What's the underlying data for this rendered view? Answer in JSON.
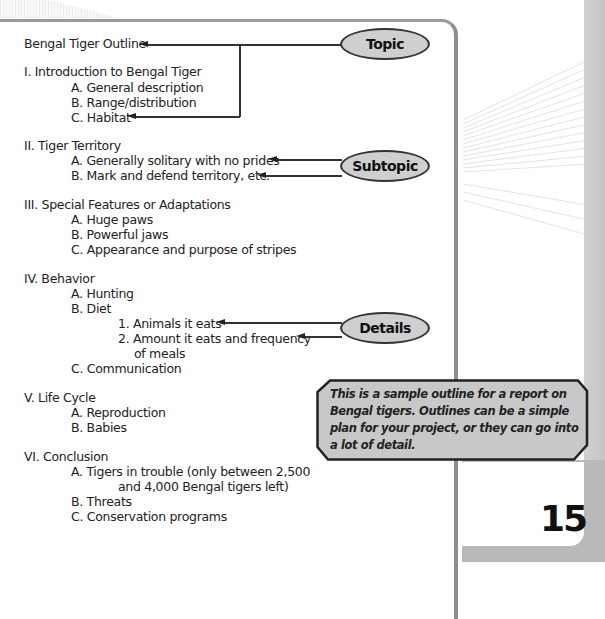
{
  "outline": {
    "title": "Bengal Tiger Outline",
    "sections": [
      {
        "heading": "I. Introduction to Bengal Tiger",
        "items": [
          "A.  General description",
          "B.  Range/distribution",
          "C.  Habitat"
        ]
      },
      {
        "heading": "II. Tiger Territory",
        "items": [
          "A.  Generally solitary with no prides",
          "B.  Mark and defend territory, etc."
        ]
      },
      {
        "heading": "III. Special Features or Adaptations",
        "items": [
          "A.  Huge paws",
          "B.  Powerful jaws",
          "C.  Appearance and purpose of stripes"
        ]
      },
      {
        "heading": "IV. Behavior",
        "items": [
          "A.  Hunting",
          "B.  Diet",
          "1.  Animals it eats",
          "2.  Amount it eats and frequency",
          "of meals",
          "C.  Communication"
        ]
      },
      {
        "heading": "V. Life Cycle",
        "items": [
          "A.  Reproduction",
          "B.  Babies"
        ]
      },
      {
        "heading": "VI. Conclusion",
        "items": [
          "A.  Tigers in trouble (only between 2,500",
          "and 4,000 Bengal tigers left)",
          "B.  Threats",
          "C.  Conservation programs"
        ]
      }
    ]
  },
  "labels": {
    "topic": "Topic",
    "subtopic": "Subtopic",
    "details": "Details"
  },
  "callout": {
    "text": "This is a sample outline for a report on Bengal tigers. Outlines can be a simple plan for your project, or they can go into a lot of detail."
  },
  "page_number": "15",
  "colors": {
    "oval_fill": "#cfcfcf",
    "callout_fill": "#c8c8c8",
    "border": "#8e8e8e"
  }
}
